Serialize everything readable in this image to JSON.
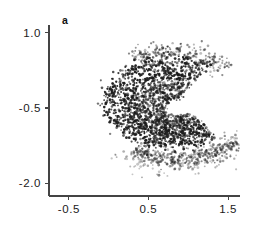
{
  "figure": {
    "panel_label": "a",
    "background_color": "#ffffff",
    "axis_color": "#444444",
    "point_color": "#1b1b1b"
  },
  "chart_data": {
    "type": "scatter",
    "title": "",
    "subtitle": "",
    "panel": "a",
    "xlabel": "",
    "ylabel": "",
    "xlim": [
      -0.75,
      1.65
    ],
    "ylim": [
      -2.25,
      1.15
    ],
    "xticks": [
      -0.5,
      0.5,
      1.5
    ],
    "xticklabels": [
      "-0.5",
      "0.5",
      "1.5"
    ],
    "yticks": [
      1.0,
      -0.5,
      -2.0
    ],
    "yticklabels": [
      "1.0",
      "-0.5",
      "-2.0"
    ],
    "grid": false,
    "legend": null,
    "marker": {
      "shape": "dot",
      "size_px": 1.1,
      "color": "#1b1b1b",
      "opacity_range": [
        0.25,
        0.95
      ]
    },
    "n_points_approx": 2600,
    "arcs": [
      {
        "name": "outer-arc",
        "center": [
          0.78,
          -0.38
        ],
        "radius_x": 0.74,
        "radius_y": 0.8,
        "start_angle_deg": 52,
        "end_angle_deg": 312,
        "thickness": 0.075,
        "n_points": 620,
        "density": "high"
      },
      {
        "name": "second-arc",
        "center": [
          0.8,
          -0.42
        ],
        "radius_x": 0.55,
        "radius_y": 0.6,
        "start_angle_deg": 58,
        "end_angle_deg": 318,
        "thickness": 0.062,
        "n_points": 560,
        "density": "high"
      },
      {
        "name": "third-arc",
        "center": [
          0.82,
          -0.46
        ],
        "radius_x": 0.38,
        "radius_y": 0.42,
        "start_angle_deg": 62,
        "end_angle_deg": 322,
        "thickness": 0.055,
        "n_points": 420,
        "density": "medium"
      },
      {
        "name": "inner-arc",
        "center": [
          0.84,
          -0.5
        ],
        "radius_x": 0.22,
        "radius_y": 0.25,
        "start_angle_deg": 70,
        "end_angle_deg": 330,
        "thickness": 0.048,
        "n_points": 250,
        "density": "medium"
      },
      {
        "name": "lower-tail-arc",
        "center": [
          0.86,
          -0.48
        ],
        "radius_x": 0.95,
        "radius_y": 1.05,
        "start_angle_deg": 235,
        "end_angle_deg": 320,
        "thickness": 0.085,
        "n_points": 330,
        "density": "low"
      },
      {
        "name": "upper-outer-fringe",
        "center": [
          0.76,
          -0.34
        ],
        "radius_x": 0.9,
        "radius_y": 0.98,
        "start_angle_deg": 35,
        "end_angle_deg": 120,
        "thickness": 0.09,
        "n_points": 230,
        "density": "low"
      },
      {
        "name": "sparse-halo",
        "center": [
          0.8,
          -0.45
        ],
        "radius_x": 1.05,
        "radius_y": 1.15,
        "start_angle_deg": 230,
        "end_angle_deg": 330,
        "thickness": 0.13,
        "n_points": 190,
        "density": "sparse"
      }
    ]
  }
}
